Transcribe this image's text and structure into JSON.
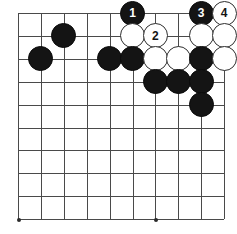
{
  "diagram": {
    "kind": "go-board-diagram",
    "board": {
      "columns": 10,
      "rows": 10,
      "origin_x": 18,
      "origin_y": 13,
      "spacing": 22.9,
      "line_color": "#4a4a4a",
      "background_color": "#ffffff",
      "star_points": [
        {
          "col": 0,
          "row": 9
        },
        {
          "col": 6,
          "row": 9
        }
      ]
    },
    "stone_colors": {
      "black_fill": "#141414",
      "black_label": "#ffffff",
      "white_fill": "#ffffff",
      "white_label": "#141414",
      "white_border": "#2e2e2e"
    },
    "stones": [
      {
        "col": 5,
        "row": 0,
        "color": "black",
        "label": "1"
      },
      {
        "col": 8,
        "row": 0,
        "color": "black",
        "label": "3"
      },
      {
        "col": 9,
        "row": 0,
        "color": "white",
        "label": "4"
      },
      {
        "col": 2,
        "row": 1,
        "color": "black",
        "label": ""
      },
      {
        "col": 5,
        "row": 1,
        "color": "white",
        "label": ""
      },
      {
        "col": 6,
        "row": 1,
        "color": "white",
        "label": "2"
      },
      {
        "col": 8,
        "row": 1,
        "color": "white",
        "label": ""
      },
      {
        "col": 9,
        "row": 1,
        "color": "white",
        "label": ""
      },
      {
        "col": 1,
        "row": 2,
        "color": "black",
        "label": ""
      },
      {
        "col": 4,
        "row": 2,
        "color": "black",
        "label": ""
      },
      {
        "col": 5,
        "row": 2,
        "color": "black",
        "label": ""
      },
      {
        "col": 6,
        "row": 2,
        "color": "white",
        "label": ""
      },
      {
        "col": 7,
        "row": 2,
        "color": "white",
        "label": ""
      },
      {
        "col": 8,
        "row": 2,
        "color": "black",
        "label": ""
      },
      {
        "col": 9,
        "row": 2,
        "color": "white",
        "label": ""
      },
      {
        "col": 6,
        "row": 3,
        "color": "black",
        "label": ""
      },
      {
        "col": 7,
        "row": 3,
        "color": "black",
        "label": ""
      },
      {
        "col": 8,
        "row": 3,
        "color": "black",
        "label": ""
      },
      {
        "col": 8,
        "row": 4,
        "color": "black",
        "label": ""
      }
    ]
  }
}
